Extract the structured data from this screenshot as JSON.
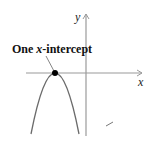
{
  "diagram": {
    "callout_label_prefix": "One ",
    "callout_label_var": "x",
    "callout_label_suffix": "-intercept",
    "x_axis_label": "x",
    "y_axis_label": "y",
    "curve": "downward-opening parabola tangent to x-axis",
    "intercept_count": 1,
    "colors": {
      "axis": "#9a9a9a",
      "curve": "#6b6b6b",
      "point": "#000000",
      "text": "#111111"
    }
  }
}
